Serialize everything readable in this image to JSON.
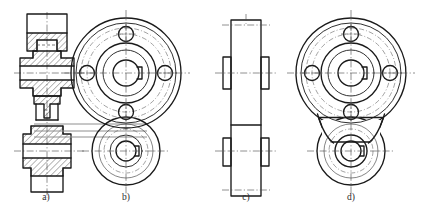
{
  "drawing": {
    "title": "Four orthographic views of a twin-hub pulley / idler bracket",
    "sheet": {
      "width": 429,
      "height": 216,
      "background": "#ffffff"
    },
    "ink": {
      "outline": "#1a1a1a",
      "thin": "#333333",
      "center": "#4a4a4a",
      "projection": "#8e8e8e",
      "hatch": "#1a1a1a"
    },
    "line_types": [
      {
        "name": "outline",
        "desc": "thick continuous visible outline"
      },
      {
        "name": "visible",
        "desc": "continuous visible edge"
      },
      {
        "name": "thin",
        "desc": "thin continuous line"
      },
      {
        "name": "hidden",
        "desc": "dashed hidden edge"
      },
      {
        "name": "center",
        "desc": "chain dash-dot centre line"
      },
      {
        "name": "projection",
        "desc": "grey projection / alignment line"
      }
    ],
    "views": [
      {
        "id": "a",
        "label": "a)",
        "label_x": 46,
        "label_y": 200,
        "type": "full-section side view",
        "hatched": true,
        "description": "Longitudinal full section through both hubs showing stepped bores, hub flanges and connecting web."
      },
      {
        "id": "b",
        "label": "b)",
        "label_x": 126,
        "label_y": 200,
        "type": "front view, separate overlapping bodies",
        "hatched": false,
        "description": "Front view: large hub disc with four equally spaced bolt holes on a pitch circle and keyed centre bore, overlapped by the smaller lower hub drawn as an independent circle."
      },
      {
        "id": "c",
        "label": "c)",
        "label_x": 246,
        "label_y": 200,
        "type": "side outline view",
        "hatched": false,
        "description": "Plain side view outline with two protruding hub bosses, no section."
      },
      {
        "id": "d",
        "label": "d)",
        "label_x": 351,
        "label_y": 200,
        "type": "front view, blended bodies",
        "hatched": false,
        "description": "Front view: same two hubs but joined by a tangent fillet web so the outlines merge into one continuous profile."
      }
    ]
  },
  "geometry": {
    "view_a": {
      "axis_x": 47,
      "upper_center_y": 73,
      "lower_center_y": 151,
      "upper_hub_half_height": 22,
      "lower_hub_half_height": 17,
      "flange_half_width": 27,
      "body_half_width": 14,
      "bore_half_width": 7,
      "web_half_width": 11
    },
    "view_b": {
      "big": {
        "cx": 126,
        "cy": 73,
        "r_outer": 55,
        "r_rim": 50,
        "r_pitch": 39,
        "r_hub_outer": 30,
        "r_hub_inner": 23,
        "r_bore": 13
      },
      "small": {
        "cx": 126,
        "cy": 151,
        "r_outer": 34,
        "r_mid": 27,
        "r_hub": 16,
        "r_bore": 10
      },
      "bolt_holes": [
        {
          "angle_deg": 90,
          "r_hole": 7.5
        },
        {
          "angle_deg": 180,
          "r_hole": 7.5
        },
        {
          "angle_deg": 270,
          "r_hole": 7.5
        },
        {
          "angle_deg": 0,
          "r_hole": 7.5
        }
      ],
      "bolt_pitch_radius": 39,
      "keyway": {
        "width": 7,
        "depth": 5
      }
    },
    "view_c": {
      "axis_x": 246,
      "upper_center_y": 73,
      "lower_center_y": 151,
      "body_half_width": 15,
      "boss_half_width": 23,
      "boss_half_height": 16,
      "upper_top_y": 20,
      "lower_bottom_y": 196
    },
    "view_d": {
      "big": {
        "cx": 351,
        "cy": 73,
        "r_outer": 55,
        "r_rim": 50,
        "r_pitch": 39,
        "r_hub_outer": 30,
        "r_hub_inner": 23,
        "r_bore": 13
      },
      "small": {
        "cx": 351,
        "cy": 151,
        "r_outer": 34,
        "r_mid": 27,
        "r_hub": 16,
        "r_bore": 10
      },
      "bolt_pitch_radius": 39,
      "blend_fillet_radius": 18
    },
    "projection_lines": [
      {
        "y": 124,
        "x1": 34,
        "x2": 147
      },
      {
        "y": 131,
        "x1": 34,
        "x2": 147
      },
      {
        "y": 137,
        "x1": 34,
        "x2": 147
      }
    ]
  }
}
